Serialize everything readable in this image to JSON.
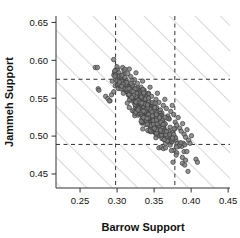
{
  "chart_data": {
    "type": "scatter",
    "title": "",
    "xlabel": "Barrow Support",
    "ylabel": "Jammeh Support",
    "xlim": [
      0.2175,
      0.4525
    ],
    "ylim": [
      0.4315,
      0.6585
    ],
    "xticks": [
      0.25,
      0.3,
      0.35,
      0.4,
      0.45
    ],
    "xticklabels": [
      "0.25",
      "0.30",
      "0.35",
      "0.40",
      "0.45"
    ],
    "yticks": [
      0.45,
      0.5,
      0.55,
      0.6,
      0.65
    ],
    "yticklabels": [
      "0.45",
      "0.50",
      "0.55",
      "0.60",
      "0.65"
    ],
    "grid": false,
    "legend": null,
    "marker": {
      "shape": "circle",
      "fill": "#808080",
      "edge": "#3d3d3d",
      "size_px": 4.4,
      "count": 640
    },
    "reference_lines": {
      "vertical": [
        {
          "value": 0.298,
          "style": "dashed",
          "color": "#333333"
        },
        {
          "value": 0.378,
          "style": "dashed",
          "color": "#333333"
        }
      ],
      "horizontal": [
        {
          "value": 0.575,
          "style": "dashed",
          "color": "#333333"
        },
        {
          "value": 0.489,
          "style": "dashed",
          "color": "#333333"
        }
      ]
    },
    "hatched_regions": {
      "description": "45-degree line hatching outside the central rectangle defined by the dashed reference lines",
      "angle_deg": 45,
      "color": "#aaaaaa",
      "spacing_px": 18
    },
    "points": [
      [
        0.2705,
        0.5905
      ],
      [
        0.2735,
        0.5905
      ],
      [
        0.2745,
        0.5625
      ],
      [
        0.2755,
        0.5605
      ],
      [
        0.2845,
        0.5525
      ],
      [
        0.2875,
        0.5495
      ],
      [
        0.2905,
        0.5465
      ],
      [
        0.2935,
        0.5725
      ],
      [
        0.2955,
        0.5805
      ],
      [
        0.2965,
        0.5845
      ],
      [
        0.2985,
        0.5875
      ],
      [
        0.3005,
        0.5885
      ],
      [
        0.3025,
        0.5835
      ],
      [
        0.3035,
        0.5795
      ],
      [
        0.3055,
        0.5765
      ],
      [
        0.3075,
        0.5905
      ],
      [
        0.3095,
        0.5865
      ],
      [
        0.3105,
        0.5745
      ],
      [
        0.3125,
        0.5705
      ],
      [
        0.3145,
        0.5825
      ],
      [
        0.3165,
        0.5885
      ],
      [
        0.3185,
        0.5785
      ],
      [
        0.3195,
        0.5665
      ],
      [
        0.3215,
        0.5625
      ],
      [
        0.3235,
        0.5745
      ],
      [
        0.3255,
        0.5835
      ],
      [
        0.3275,
        0.5695
      ],
      [
        0.3285,
        0.5585
      ],
      [
        0.3305,
        0.5545
      ],
      [
        0.3325,
        0.5645
      ],
      [
        0.3345,
        0.5725
      ],
      [
        0.3365,
        0.5605
      ],
      [
        0.3385,
        0.5505
      ],
      [
        0.3405,
        0.5465
      ],
      [
        0.3425,
        0.5565
      ],
      [
        0.3445,
        0.5645
      ],
      [
        0.3465,
        0.5525
      ],
      [
        0.3485,
        0.5425
      ],
      [
        0.3505,
        0.5385
      ],
      [
        0.3525,
        0.5485
      ],
      [
        0.3545,
        0.5565
      ],
      [
        0.3565,
        0.5445
      ],
      [
        0.3585,
        0.5345
      ],
      [
        0.3605,
        0.5305
      ],
      [
        0.3625,
        0.5405
      ],
      [
        0.3645,
        0.5485
      ],
      [
        0.3665,
        0.5365
      ],
      [
        0.3685,
        0.5265
      ],
      [
        0.3705,
        0.5225
      ],
      [
        0.3725,
        0.5325
      ],
      [
        0.3745,
        0.5405
      ],
      [
        0.3765,
        0.5285
      ],
      [
        0.3785,
        0.5185
      ],
      [
        0.3805,
        0.5145
      ],
      [
        0.3825,
        0.5245
      ],
      [
        0.3845,
        0.5105
      ],
      [
        0.3865,
        0.5065
      ],
      [
        0.3885,
        0.5165
      ],
      [
        0.3905,
        0.5025
      ],
      [
        0.3925,
        0.4985
      ],
      [
        0.3945,
        0.5085
      ],
      [
        0.3965,
        0.4945
      ],
      [
        0.3985,
        0.4905
      ],
      [
        0.4005,
        0.5005
      ],
      [
        0.3905,
        0.4795
      ],
      [
        0.4065,
        0.4695
      ],
      [
        0.4085,
        0.4655
      ],
      [
        0.3755,
        0.4655
      ],
      [
        0.3565,
        0.4845
      ],
      [
        0.3595,
        0.4855
      ],
      [
        0.3625,
        0.4835
      ],
      [
        0.3655,
        0.4845
      ],
      [
        0.2895,
        0.5465
      ],
      [
        0.2925,
        0.5545
      ],
      [
        0.2955,
        0.5585
      ],
      [
        0.2975,
        0.5665
      ],
      [
        0.3015,
        0.5745
      ],
      [
        0.3045,
        0.5685
      ],
      [
        0.3065,
        0.5625
      ],
      [
        0.3085,
        0.5565
      ],
      [
        0.3115,
        0.5625
      ],
      [
        0.3135,
        0.5585
      ],
      [
        0.3155,
        0.5545
      ],
      [
        0.3175,
        0.5505
      ],
      [
        0.3205,
        0.5545
      ],
      [
        0.3225,
        0.5505
      ],
      [
        0.3245,
        0.5465
      ],
      [
        0.3265,
        0.5425
      ],
      [
        0.3295,
        0.5465
      ],
      [
        0.3315,
        0.5425
      ],
      [
        0.3335,
        0.5385
      ],
      [
        0.3355,
        0.5345
      ],
      [
        0.3375,
        0.5385
      ],
      [
        0.3395,
        0.5345
      ],
      [
        0.3415,
        0.5305
      ],
      [
        0.3435,
        0.5265
      ],
      [
        0.3455,
        0.5305
      ],
      [
        0.3475,
        0.5265
      ],
      [
        0.3495,
        0.5225
      ],
      [
        0.3515,
        0.5185
      ],
      [
        0.3535,
        0.5225
      ],
      [
        0.3555,
        0.5185
      ],
      [
        0.3575,
        0.5145
      ],
      [
        0.3595,
        0.5105
      ],
      [
        0.3615,
        0.5145
      ],
      [
        0.3635,
        0.5105
      ],
      [
        0.3655,
        0.5065
      ],
      [
        0.3675,
        0.5025
      ],
      [
        0.3695,
        0.5065
      ],
      [
        0.3715,
        0.5025
      ],
      [
        0.3735,
        0.4985
      ],
      [
        0.3755,
        0.4945
      ],
      [
        0.3775,
        0.4985
      ],
      [
        0.3795,
        0.4945
      ],
      [
        0.3815,
        0.4905
      ],
      [
        0.3835,
        0.4865
      ],
      [
        0.3855,
        0.4905
      ],
      [
        0.3875,
        0.4865
      ],
      [
        0.3895,
        0.4905
      ],
      [
        0.3915,
        0.4885
      ]
    ]
  },
  "axes": {
    "tick_color": "#333333",
    "frame_color": "#333333"
  }
}
